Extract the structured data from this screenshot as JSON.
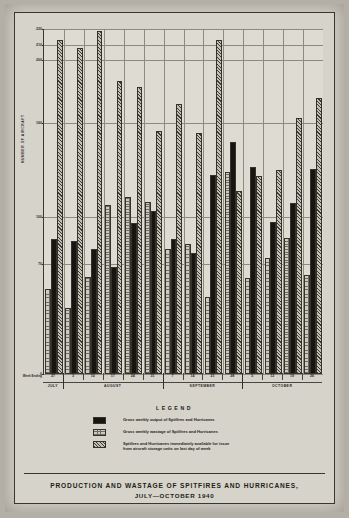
{
  "chart_data": {
    "type": "bar",
    "title": "PRODUCTION AND WASTAGE OF SPITFIRES AND HURRICANES,",
    "subtitle": "JULY—OCTOBER 1940",
    "xlabel": "Week Ending",
    "ylabel": "NUMBER OF AIRCRAFT",
    "grid": true,
    "legend_position": "below-plot",
    "legend_title": "LEGEND",
    "ylim": [
      0,
      220
    ],
    "yticks": [
      0,
      70,
      100,
      160,
      200,
      210,
      220
    ],
    "ytick_labels": [
      "0",
      "70",
      "100",
      "160",
      "200",
      "210",
      "220"
    ],
    "gridline_values": [
      220,
      210,
      200,
      160,
      100,
      70,
      0
    ],
    "categories": [
      "27",
      "3",
      "10",
      "17",
      "24",
      "31",
      "7",
      "14",
      "21",
      "28",
      "5",
      "12",
      "19",
      "26"
    ],
    "months": [
      {
        "name": "JULY",
        "weeks": [
          "27"
        ]
      },
      {
        "name": "AUGUST",
        "weeks": [
          "3",
          "10",
          "17",
          "24",
          "31"
        ]
      },
      {
        "name": "SEPTEMBER",
        "weeks": [
          "7",
          "14",
          "21",
          "28"
        ]
      },
      {
        "name": "OCTOBER",
        "weeks": [
          "5",
          "12",
          "19",
          "26"
        ]
      }
    ],
    "series": [
      {
        "name": "Gross weekly output of Spitfires and Hurricanes",
        "key": "output",
        "pattern": "solid-black",
        "values": [
          86,
          85,
          80,
          68,
          96,
          104,
          86,
          77,
          127,
          148,
          132,
          97,
          109,
          131
        ]
      },
      {
        "name": "Gross weekly wastage of Spitfires and Hurricanes",
        "key": "wastage",
        "pattern": "stipple",
        "values": [
          54,
          42,
          62,
          108,
          113,
          110,
          80,
          83,
          49,
          129,
          61,
          74,
          87,
          63
        ]
      },
      {
        "name": "Spitfires and Hurricanes immediately available for issue\nfrom aircraft storage units on last day of week",
        "key": "available",
        "pattern": "diagonal-hatch",
        "values": [
          213,
          208,
          219,
          187,
          183,
          155,
          172,
          154,
          213,
          117,
          126,
          130,
          163,
          176
        ]
      }
    ]
  },
  "legend": {
    "title": "LEGEND",
    "entries": [
      {
        "swatch": "output",
        "text": "Gross weekly output of Spitfires and Hurricanes"
      },
      {
        "swatch": "wastage",
        "text": "Gross weekly wastage of Spitfires and Hurricanes"
      },
      {
        "swatch": "available",
        "text": "Spitfires and Hurricanes immediately available for issue\nfrom aircraft storage units on last day of week"
      }
    ]
  },
  "axis": {
    "week_ending_label": "Week\nEnding",
    "y_axis_title": "NUMBER OF AIRCRAFT"
  },
  "footer": {
    "title_line1": "PRODUCTION AND WASTAGE OF SPITFIRES AND HURRICANES,",
    "title_line2": "JULY—OCTOBER 1940"
  }
}
